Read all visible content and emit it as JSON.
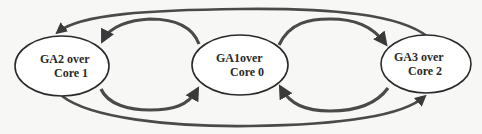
{
  "diagram": {
    "type": "cyclic-migration",
    "colors": {
      "background": "#f7f7f5",
      "stroke": "#2a2a2a",
      "arrow": "#4a4a4a",
      "node_fill": "#ffffff"
    },
    "nodes": [
      {
        "id": "ga2",
        "line1": "GA2 over",
        "line2": "Core 1",
        "cx": 62,
        "cy": 66,
        "rx": 47,
        "ry": 30
      },
      {
        "id": "ga1",
        "line1": "GA1over",
        "line2": "Core 0",
        "cx": 240,
        "cy": 65,
        "rx": 48,
        "ry": 30
      },
      {
        "id": "ga3",
        "line1": "GA3 over",
        "line2": "Core 2",
        "cx": 426,
        "cy": 64,
        "rx": 45,
        "ry": 29
      }
    ],
    "edges": [
      {
        "from": "ga1",
        "to": "ga2",
        "position": "top-inner"
      },
      {
        "from": "ga2",
        "to": "ga1",
        "position": "bottom-inner"
      },
      {
        "from": "ga3",
        "to": "ga1",
        "position": "top-inner"
      },
      {
        "from": "ga1",
        "to": "ga3",
        "position": "bottom-inner"
      },
      {
        "from": "ga3",
        "to": "ga2",
        "position": "top-outer"
      },
      {
        "from": "ga2",
        "to": "ga3",
        "position": "bottom-outer"
      }
    ]
  }
}
